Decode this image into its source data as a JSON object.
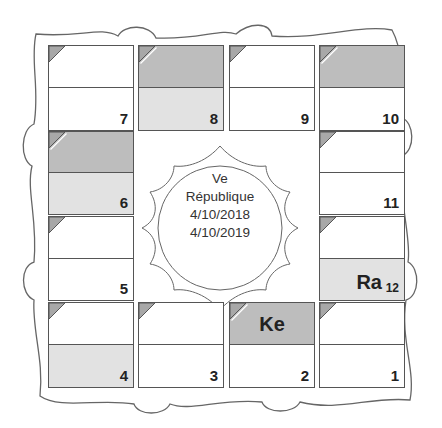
{
  "center": {
    "line1": "Ve",
    "line2": "République",
    "line3": "4/10/2018",
    "line4": "4/10/2019"
  },
  "houses": [
    {
      "num": "7",
      "top": "white",
      "bottom": "white",
      "planet": ""
    },
    {
      "num": "8",
      "top": "dark",
      "bottom": "light",
      "planet": ""
    },
    {
      "num": "9",
      "top": "white",
      "bottom": "white",
      "planet": ""
    },
    {
      "num": "10",
      "top": "dark",
      "bottom": "white",
      "planet": ""
    },
    {
      "num": "6",
      "top": "dark",
      "bottom": "light",
      "planet": ""
    },
    {
      "num": "11",
      "top": "white",
      "bottom": "white",
      "planet": ""
    },
    {
      "num": "5",
      "top": "white",
      "bottom": "white",
      "planet": ""
    },
    {
      "num": "12",
      "top": "white",
      "bottom": "light",
      "planet": "Ra"
    },
    {
      "num": "4",
      "top": "white",
      "bottom": "light",
      "planet": ""
    },
    {
      "num": "3",
      "top": "white",
      "bottom": "white",
      "planet": ""
    },
    {
      "num": "2",
      "top": "dark",
      "bottom": "white",
      "planet": "Ke"
    },
    {
      "num": "1",
      "top": "white",
      "bottom": "white",
      "planet": ""
    }
  ],
  "colors": {
    "border": "#555555",
    "dark_shade": "#bdbdbd",
    "light_shade": "#e2e2e2"
  }
}
